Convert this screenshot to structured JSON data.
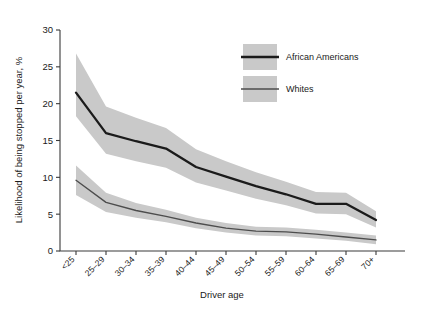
{
  "chart_data": {
    "type": "line",
    "title": "",
    "xlabel": "Driver age",
    "ylabel": "Likelihood of being stopped per year, %",
    "categories": [
      "<25",
      "25–29",
      "30–34",
      "35–39",
      "40–44",
      "45–49",
      "50–54",
      "55–59",
      "60–64",
      "65–69",
      "70+"
    ],
    "ylim": [
      0,
      30
    ],
    "yticks": [
      0,
      5,
      10,
      15,
      20,
      25,
      30
    ],
    "ytick_labels": [
      "0",
      "5",
      "10",
      "15",
      "20",
      "25",
      "30"
    ],
    "grid": false,
    "legend_position": "top-right",
    "series": [
      {
        "name": "African Americans",
        "color": "#1b1b1b",
        "band_color": "#c9c9c9",
        "values": [
          21.5,
          16.0,
          14.9,
          13.9,
          11.4,
          10.1,
          8.8,
          7.7,
          6.4,
          6.4,
          4.2
        ],
        "band_upper": [
          26.8,
          19.6,
          18.1,
          16.7,
          13.8,
          12.2,
          10.7,
          9.4,
          8.0,
          7.9,
          5.4
        ],
        "band_lower": [
          18.3,
          13.2,
          12.2,
          11.3,
          9.3,
          8.2,
          7.1,
          6.2,
          5.1,
          5.0,
          3.2
        ]
      },
      {
        "name": "Whites",
        "color": "#4d4d4d",
        "band_color": "#c9c9c9",
        "values": [
          9.6,
          6.6,
          5.5,
          4.7,
          3.8,
          3.1,
          2.7,
          2.6,
          2.3,
          1.9,
          1.5
        ],
        "band_upper": [
          11.6,
          7.9,
          6.5,
          5.6,
          4.5,
          3.8,
          3.3,
          3.2,
          2.9,
          2.5,
          2.1
        ],
        "band_lower": [
          7.6,
          5.3,
          4.5,
          3.9,
          3.1,
          2.5,
          2.1,
          2.0,
          1.7,
          1.4,
          0.9
        ]
      }
    ]
  },
  "legend": {
    "items": [
      {
        "label": "African Americans"
      },
      {
        "label": "Whites"
      }
    ]
  }
}
